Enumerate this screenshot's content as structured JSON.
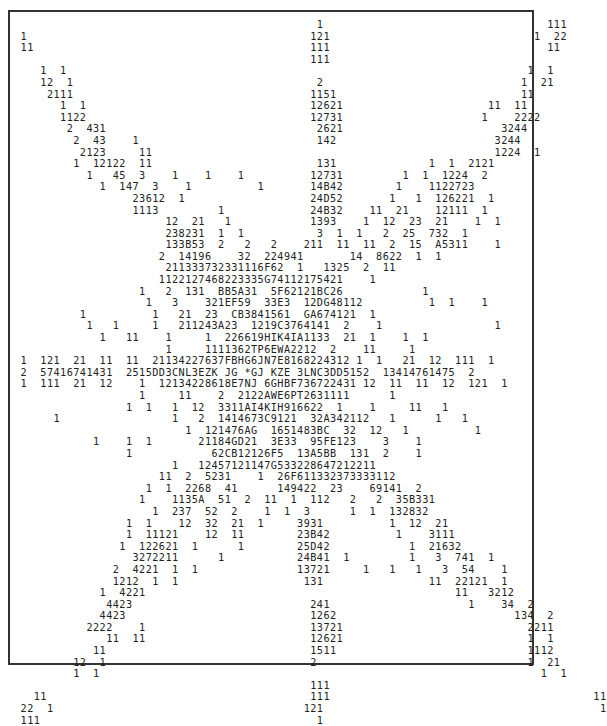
{
  "figure": {
    "rows": [
      "                                              1                                  111",
      " 1                                           121                               1  22",
      " 11                                          111                                 11",
      "                                             111",
      "    1  1                                                                      1  1",
      "    12  1                                     2                              1  21",
      "     2111                                    1151                            11",
      "       1  1                                  12621                      11  11",
      "       1122                                  12731                     1    2222",
      "        2  431                                2621                        3244",
      "         2  43    1                           142                        3244",
      "          2123     11                                                    1224  1",
      "         1  12122  11                         131              1  1  2121",
      "           1   45  3    1    1    1          12731         1  1  1224  2",
      "             1  147  3    1          1       14B42        1    1122723",
      "                  23612  1                   24D52       1   1  126221  1",
      "                  1113         1             24B32    11  21    12111  1",
      "                       12  21   1            1393    1  12  23  21    1  1",
      "                       238231  1  1           3  1  1   2  25  732  1",
      "                       133B53  2   2   2    211  11  11  2  15  A5311    1",
      "                      2  14196    32  224941       14  8622  1  1",
      "                       211333732331116F62  1   1325  2  11",
      "                      1122127468223335G74112175421    1",
      "                   1   2  131  BB5A31  5F62121BC26            1",
      "                    1   3    321EF59  33E3  12DG48112          1  1    1",
      "          1          1   21  23  CB3841561  GA674121  1",
      "           1   1     1   211243A23  1219C3764141  2    1                 1",
      "             1   11    1     1  226619HIK4IA1133  21  1    1  1",
      "                       1     1111362TP6EWA2212  2    11     1",
      " 1  121  21  11  11  21134227637FBHG6JN7E8168224312 1  1   21  12  111  1",
      " 2  57416741431  2515DD3CNL3EZK JG *GJ KZE 3LNC3DD5152  13414761475  2",
      " 1  111  21  12    1  12134228618E7NJ 6GHBF736722431 12  11  11  12  121  1",
      "                   1     11    2  2122AWE6PT2631111      1",
      "                 1  1   1  12  3311AI4KIH916622  1    1     11   1",
      "      1                 1   2  1414673C9121  32A342112   1      1   1",
      "                          1  121476AG  1651483BC  32  12   1          1",
      "            1    1  1       21184GD21  3E33  95FE123    3    1",
      "                 1            62CB12126F5  13A5BB  131  2    1",
      "                        1   12457121147G533228647212211",
      "                      11  2  5231    1  26F611332373333112",
      "                    1  1  2268  41      149422  23    69141  2",
      "                   1    1135A  51  2  11  1  112   2   2  35B331",
      "                     1  237  52  2    1  1  3      1  1  132832",
      "                 1  1    12  32  21  1     3931          1  12  21",
      "                 1  11121    12  11        23B42          1    3111",
      "                1  122621  1      1        25D42            1  21632",
      "                  3272211      1           24B41  1         1   3  741  1",
      "               2  4221  1  1               13721     1   1   1   3  54    1",
      "               1212  1  1                   131                11  22121  1",
      "             1  4221                                               11   3212",
      "              4423                           241                     1    34  2",
      "             4423                            1262                           134  2",
      "           2222    1                         13721                            2211",
      "              11  11                         12621                            1  1",
      "            11                               1511                             1112",
      "         12  1                               2                                1  21",
      "         1  1                                                                   1  1",
      "                                             111",
      "   11                                        111                                        11",
      " 22  1                                      121                                          1",
      " 111                                          1"
    ]
  }
}
